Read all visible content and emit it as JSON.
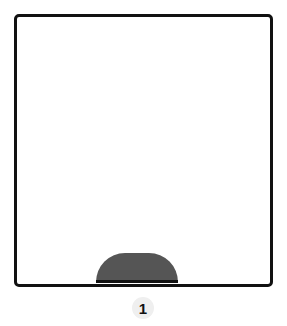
{
  "diagram": {
    "panel_label": "1",
    "shapes": [
      {
        "type": "frame",
        "description": "hand-drawn rounded square outline"
      },
      {
        "type": "semicircle",
        "description": "dark gray half-dome sitting on bottom edge",
        "color": "#555555"
      }
    ]
  },
  "colors": {
    "outline": "#111111",
    "fill": "#555555",
    "badge_bg": "#efefef"
  }
}
